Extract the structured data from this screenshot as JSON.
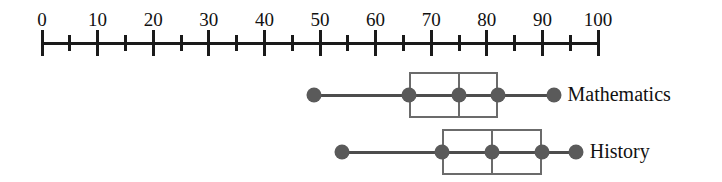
{
  "chart_data": {
    "type": "box",
    "title": "",
    "xlabel": "",
    "ylabel": "",
    "orientation": "horizontal",
    "axis": {
      "min": 0,
      "max": 100,
      "major_step": 10,
      "minor_step": 5,
      "grid": false,
      "tick_labels": [
        "0",
        "10",
        "20",
        "30",
        "40",
        "50",
        "60",
        "70",
        "80",
        "90",
        "100"
      ],
      "tick_values": [
        0,
        10,
        20,
        30,
        40,
        50,
        60,
        70,
        80,
        90,
        100
      ],
      "minor_tick_values": [
        5,
        15,
        25,
        35,
        45,
        55,
        65,
        75,
        85,
        95
      ]
    },
    "legend_position": "right",
    "series": [
      {
        "name": "Mathematics",
        "min": 49,
        "q1": 66,
        "median": 75,
        "q3": 82,
        "max": 92
      },
      {
        "name": "History",
        "min": 54,
        "q1": 72,
        "median": 81,
        "q3": 90,
        "max": 96
      }
    ],
    "colors": {
      "axis": "#1a1a1a",
      "box_outline": "#6b6b6b",
      "marker": "#5a5a5a",
      "whisker": "#4d4d4d",
      "text": "#111111",
      "background": "#ffffff"
    }
  }
}
